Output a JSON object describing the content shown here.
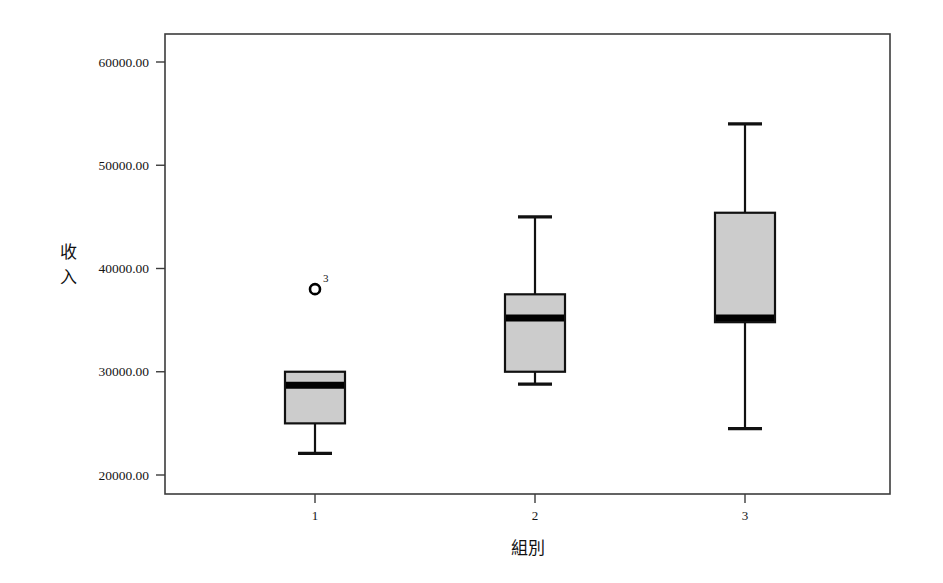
{
  "chart_data": {
    "type": "box",
    "title": "",
    "xlabel": "組別",
    "ylabel": "收入",
    "ylabel_chars": [
      "收",
      "入"
    ],
    "categories": [
      "1",
      "2",
      "3"
    ],
    "x_tick_labels": [
      "1",
      "2",
      "3"
    ],
    "y_tick_labels": [
      "20000.00",
      "30000.00",
      "40000.00",
      "50000.00",
      "60000.00"
    ],
    "y_tick_values": [
      20000,
      30000,
      40000,
      50000,
      60000
    ],
    "ylim": [
      17800,
      62000
    ],
    "grid": false,
    "legend": "none",
    "box_fill_color": "#cccccc",
    "box_stroke_color": "#111111",
    "median_color": "#000000",
    "axis_color": "#3c3c3c",
    "boxes": [
      {
        "category": "1",
        "whisker_low": 22100,
        "q1": 25000,
        "median": 28700,
        "q3": 30000,
        "whisker_high": 30000,
        "outliers": [
          {
            "value": 38000,
            "label": "3"
          }
        ]
      },
      {
        "category": "2",
        "whisker_low": 28800,
        "q1": 30000,
        "median": 35200,
        "q3": 37500,
        "whisker_high": 45000,
        "outliers": []
      },
      {
        "category": "3",
        "whisker_low": 24500,
        "q1": 34800,
        "median": 35200,
        "q3": 45400,
        "whisker_high": 54000,
        "outliers": []
      }
    ]
  }
}
